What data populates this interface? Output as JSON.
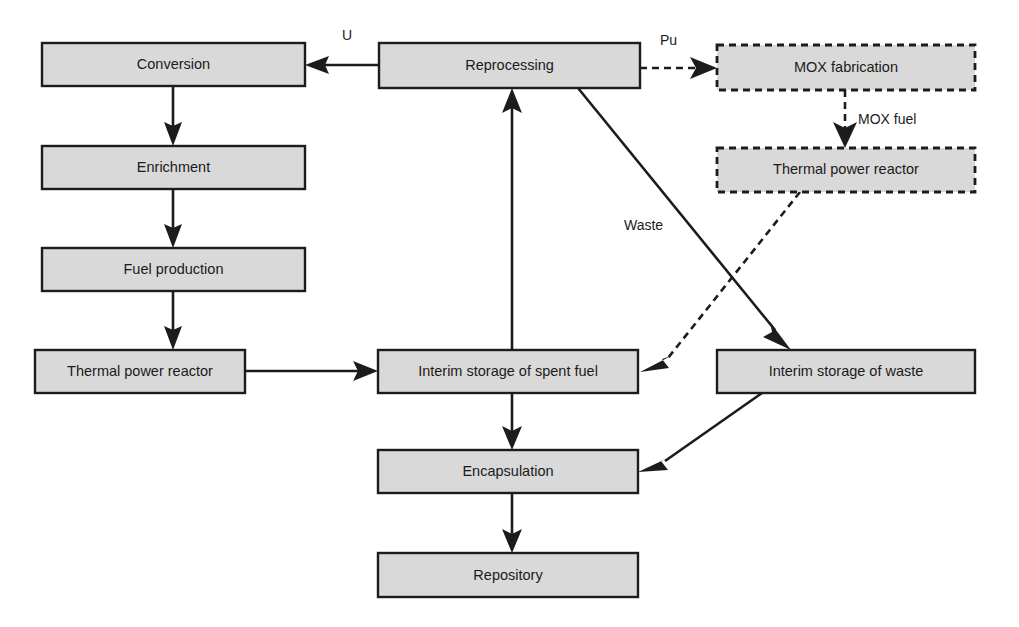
{
  "diagram": {
    "colors": {
      "node_fill": "#d9d9d9",
      "node_stroke": "#1c1c1c",
      "edge_stroke": "#1c1c1c",
      "background": "#ffffff"
    },
    "nodes": [
      {
        "id": "conversion",
        "label": "Conversion",
        "style": "solid",
        "x": 42,
        "y": 43,
        "w": 263,
        "h": 43
      },
      {
        "id": "enrichment",
        "label": "Enrichment",
        "style": "solid",
        "x": 42,
        "y": 146,
        "w": 263,
        "h": 43
      },
      {
        "id": "fuel-production",
        "label": "Fuel production",
        "style": "solid",
        "x": 42,
        "y": 248,
        "w": 263,
        "h": 43
      },
      {
        "id": "thermal-power-reactor",
        "label": "Thermal power reactor",
        "style": "solid",
        "x": 35,
        "y": 350,
        "w": 210,
        "h": 43
      },
      {
        "id": "reprocessing",
        "label": "Reprocessing",
        "style": "solid",
        "x": 379,
        "y": 43,
        "w": 261,
        "h": 45
      },
      {
        "id": "mox-fabrication",
        "label": "MOX fabrication",
        "style": "dashed",
        "x": 717,
        "y": 45,
        "w": 258,
        "h": 45
      },
      {
        "id": "mox-thermal-reactor",
        "label": "Thermal power reactor",
        "style": "dashed",
        "x": 717,
        "y": 148,
        "w": 258,
        "h": 44
      },
      {
        "id": "interim-spent-fuel",
        "label": "Interim storage of spent fuel",
        "style": "solid",
        "x": 378,
        "y": 350,
        "w": 260,
        "h": 43
      },
      {
        "id": "interim-waste",
        "label": "Interim storage of waste",
        "style": "solid",
        "x": 717,
        "y": 350,
        "w": 258,
        "h": 43
      },
      {
        "id": "encapsulation",
        "label": "Encapsulation",
        "style": "solid",
        "x": 378,
        "y": 450,
        "w": 260,
        "h": 43
      },
      {
        "id": "repository",
        "label": "Repository",
        "style": "solid",
        "x": 378,
        "y": 553,
        "w": 260,
        "h": 44
      }
    ],
    "edges": [
      {
        "id": "reprocessing-to-conversion",
        "from": "reprocessing",
        "to": "conversion",
        "label": "U",
        "style": "solid"
      },
      {
        "id": "conversion-to-enrichment",
        "from": "conversion",
        "to": "enrichment",
        "label": "",
        "style": "solid"
      },
      {
        "id": "enrichment-to-fuel-production",
        "from": "enrichment",
        "to": "fuel-production",
        "label": "",
        "style": "solid"
      },
      {
        "id": "fuel-production-to-reactor",
        "from": "fuel-production",
        "to": "thermal-power-reactor",
        "label": "",
        "style": "solid"
      },
      {
        "id": "reactor-to-interim-spent-fuel",
        "from": "thermal-power-reactor",
        "to": "interim-spent-fuel",
        "label": "",
        "style": "solid"
      },
      {
        "id": "interim-spent-fuel-to-reprocessing",
        "from": "interim-spent-fuel",
        "to": "reprocessing",
        "label": "",
        "style": "solid"
      },
      {
        "id": "reprocessing-to-mox-fabrication",
        "from": "reprocessing",
        "to": "mox-fabrication",
        "label": "Pu",
        "style": "dashed"
      },
      {
        "id": "mox-fabrication-to-mox-reactor",
        "from": "mox-fabrication",
        "to": "mox-thermal-reactor",
        "label": "MOX fuel",
        "style": "dashed"
      },
      {
        "id": "mox-reactor-to-interim-spent-fuel",
        "from": "mox-thermal-reactor",
        "to": "interim-spent-fuel",
        "label": "",
        "style": "dashed"
      },
      {
        "id": "reprocessing-to-interim-waste",
        "from": "reprocessing",
        "to": "interim-waste",
        "label": "Waste",
        "style": "solid"
      },
      {
        "id": "interim-spent-fuel-to-encapsulation",
        "from": "interim-spent-fuel",
        "to": "encapsulation",
        "label": "",
        "style": "solid"
      },
      {
        "id": "interim-waste-to-encapsulation",
        "from": "interim-waste",
        "to": "encapsulation",
        "label": "",
        "style": "solid"
      },
      {
        "id": "encapsulation-to-repository",
        "from": "encapsulation",
        "to": "repository",
        "label": "",
        "style": "solid"
      }
    ],
    "edge_labels": {
      "u": "U",
      "pu": "Pu",
      "mox_fuel": "MOX fuel",
      "waste": "Waste"
    }
  }
}
